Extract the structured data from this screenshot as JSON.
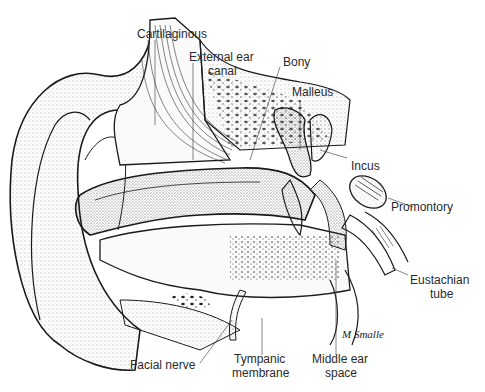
{
  "diagram": {
    "labels": {
      "cartilaginous": "Cartilaginous",
      "external_ear_canal_1": "External ear",
      "external_ear_canal_2": "canal",
      "bony": "Bony",
      "malleus": "Malleus",
      "incus": "Incus",
      "promontory": "Promontory",
      "eustachian_tube_1": "Eustachian",
      "eustachian_tube_2": "tube",
      "facial_nerve": "Facial nerve",
      "tympanic_membrane_1": "Tympanic",
      "tympanic_membrane_2": "membrane",
      "middle_ear_space_1": "Middle ear",
      "middle_ear_space_2": "space"
    },
    "signature": "M Smalle",
    "colors": {
      "ink": "#1a1a1a",
      "stipple": "#555555",
      "background": "#ffffff"
    }
  }
}
